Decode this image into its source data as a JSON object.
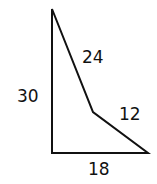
{
  "diagram": {
    "type": "polygon",
    "shape": "quadrilateral",
    "stroke_color": "#111111",
    "background": "#ffffff",
    "vertices": [
      {
        "x": 52,
        "y": 9
      },
      {
        "x": 93,
        "y": 112
      },
      {
        "x": 148,
        "y": 153
      },
      {
        "x": 52,
        "y": 153
      }
    ],
    "sides": [
      {
        "id": "left",
        "label": "30"
      },
      {
        "id": "upper-diagonal",
        "label": "24"
      },
      {
        "id": "lower-diagonal",
        "label": "12"
      },
      {
        "id": "bottom",
        "label": "18"
      }
    ]
  }
}
